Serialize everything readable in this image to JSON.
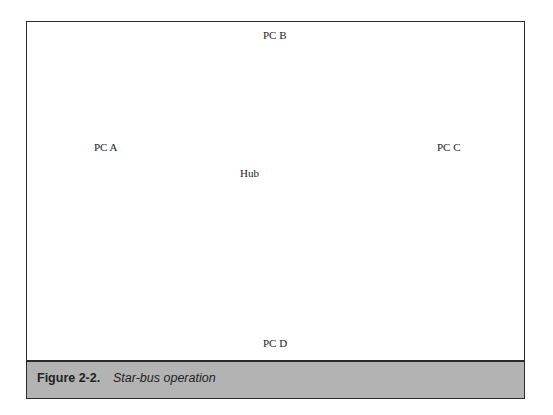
{
  "figure": {
    "number_label": "Figure 2-2.",
    "title": "Star-bus operation"
  },
  "nodes": {
    "pc_a": {
      "label": "PC A"
    },
    "pc_b": {
      "label": "PC B"
    },
    "pc_c": {
      "label": "PC C"
    },
    "pc_d": {
      "label": "PC D"
    },
    "hub": {
      "label": "Hub"
    }
  },
  "edges": [
    {
      "from": "hub",
      "to": "pc_b",
      "direction": "hub-to-pc"
    },
    {
      "from": "hub",
      "to": "pc_a",
      "direction": "hub-to-pc"
    },
    {
      "from": "hub",
      "to": "pc_d",
      "direction": "hub-to-pc"
    },
    {
      "from": "pc_c",
      "to": "hub",
      "direction": "pc-to-hub"
    }
  ],
  "colors": {
    "caption_bar": "#b3b3b3",
    "frame_border": "#2a2a2a",
    "line": "#333333"
  }
}
